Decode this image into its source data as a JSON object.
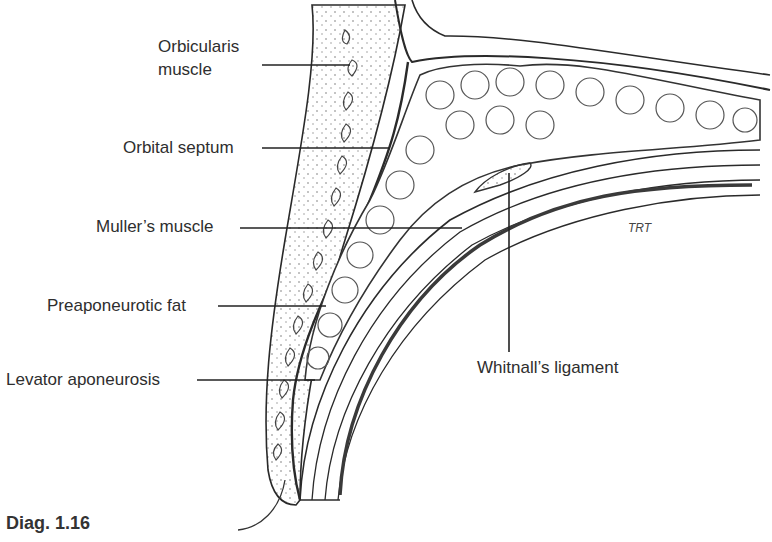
{
  "figure": {
    "caption": "Diag. 1.16",
    "artist_initials": "TRT",
    "labels": {
      "orbicularis_line1": "Orbicularis",
      "orbicularis_line2": "muscle",
      "orbital_septum": "Orbital septum",
      "mullers_muscle": "Muller’s muscle",
      "preaponeurotic_fat": "Preaponeurotic fat",
      "levator_aponeurosis": "Levator aponeurosis",
      "whitnalls_ligament": "Whitnall’s ligament"
    },
    "colors": {
      "line": "#2a2a2a",
      "background": "#ffffff"
    }
  }
}
